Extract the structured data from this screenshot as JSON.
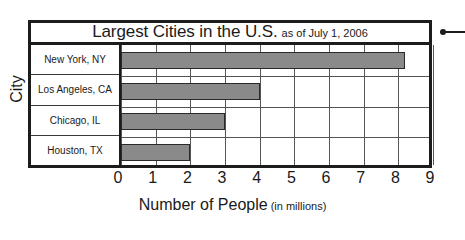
{
  "chart_data": {
    "type": "bar",
    "orientation": "horizontal",
    "title": "Largest Cities in the U.S.",
    "subtitle": "as of July 1, 2006",
    "categories": [
      "New York, NY",
      "Los Angeles, CA",
      "Chicago, IL",
      "Houston, TX"
    ],
    "values": [
      8.2,
      4.0,
      3.0,
      2.0
    ],
    "xlabel": "Number of People",
    "xlabel_unit": "(in millions)",
    "ylabel": "City",
    "xlim": [
      0,
      9
    ],
    "xticks": [
      "0",
      "1",
      "2",
      "3",
      "4",
      "5",
      "6",
      "7",
      "8",
      "9"
    ],
    "grid": true,
    "legend": false,
    "bar_color": "#8a8a8a",
    "frame_color": "#1c1c1c"
  },
  "annotation": {
    "marker": "pointer-dot"
  }
}
